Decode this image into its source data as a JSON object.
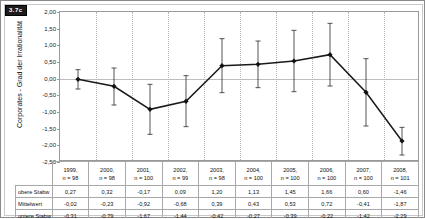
{
  "figure": {
    "badge": "3.7c",
    "yaxis_title": "Corporates - Grad der Irrationalität"
  },
  "table": {
    "row_labels": {
      "upper": "obere Stabw",
      "mean": "Mittelwert",
      "lower": "untere Stabw"
    }
  },
  "chart_data": {
    "type": "line",
    "title": "",
    "xlabel": "",
    "ylabel": "Corporates - Grad der Irrationalität",
    "ylim": [
      -2.5,
      2.0
    ],
    "ytick_labels": [
      "2,00",
      "1,50",
      "1,00",
      "0,50",
      "0,00",
      "-0,50",
      "-1,00",
      "-1,50",
      "-2,00",
      "-2,50"
    ],
    "ytick_values": [
      2.0,
      1.5,
      1.0,
      0.5,
      0.0,
      -0.5,
      -1.0,
      -1.5,
      -2.0,
      -2.5
    ],
    "grid": "vertical-dotted",
    "legend": "none",
    "categories": [
      "1999",
      "2000",
      "2001",
      "2002",
      "2003",
      "2004",
      "2005",
      "2006",
      "2007",
      "2008"
    ],
    "sample_sizes": [
      "n = 98",
      "n = 98",
      "n = 100",
      "n = 99",
      "n = 98",
      "n = 100",
      "n = 100",
      "n = 100",
      "n = 100",
      "n = 101"
    ],
    "series": [
      {
        "name": "Mittelwert",
        "values": [
          -0.02,
          -0.23,
          -0.92,
          -0.68,
          0.39,
          0.43,
          0.53,
          0.72,
          -0.41,
          -1.87
        ],
        "labels": [
          "-0,02",
          "-0,23",
          "-0,92",
          "-0,68",
          "0,39",
          "0,43",
          "0,53",
          "0,72",
          "-0,41",
          "-1,87"
        ]
      },
      {
        "name": "obere Stabw",
        "values": [
          0.27,
          0.32,
          -0.17,
          0.09,
          1.2,
          1.13,
          1.45,
          1.66,
          0.6,
          -1.46
        ],
        "labels": [
          "0,27",
          "0,32",
          "-0,17",
          "0,09",
          "1,20",
          "1,13",
          "1,45",
          "1,66",
          "0,60",
          "-1,46"
        ]
      },
      {
        "name": "untere Stabw",
        "values": [
          -0.31,
          -0.79,
          -1.67,
          -1.44,
          -0.42,
          -0.27,
          -0.39,
          -0.22,
          -1.42,
          -2.29
        ],
        "labels": [
          "-0,31",
          "-0,79",
          "-1,67",
          "-1,44",
          "-0,42",
          "-0,27",
          "-0,39",
          "-0,22",
          "-1,42",
          "-2,29"
        ]
      }
    ]
  }
}
